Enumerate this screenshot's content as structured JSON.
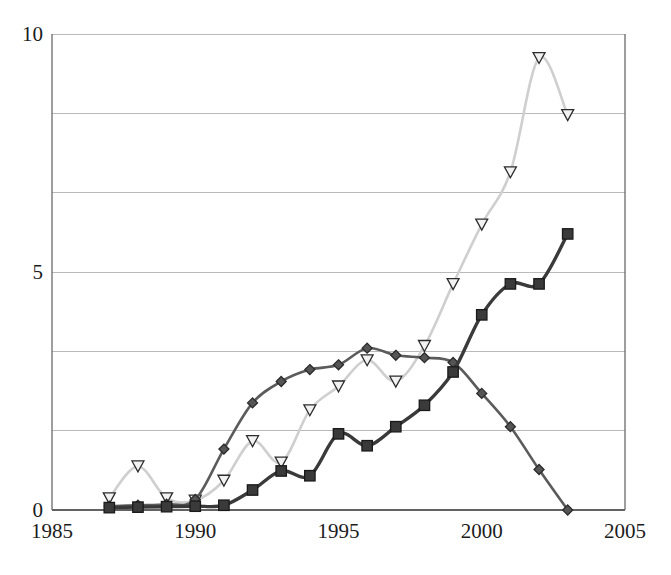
{
  "chart_data": {
    "type": "line",
    "title": "",
    "subtitle": "",
    "xlabel": "",
    "ylabel": "",
    "xlim": [
      1985,
      2005
    ],
    "ylim": [
      0,
      10
    ],
    "grid": true,
    "grid_axis": "y",
    "legend": "none",
    "x_ticks": [
      1985,
      1990,
      1995,
      2000,
      2005
    ],
    "x_tick_labels": [
      "1985",
      "1990",
      "1995",
      "2000",
      "2005"
    ],
    "y_ticks": [
      0,
      5,
      10
    ],
    "y_tick_labels": [
      "0",
      "5",
      "10"
    ],
    "y_gridlines": [
      0,
      1.667,
      3.333,
      5,
      6.667,
      8.333,
      10
    ],
    "x": [
      1987,
      1988,
      1989,
      1990,
      1991,
      1992,
      1993,
      1994,
      1995,
      1996,
      1997,
      1998,
      1999,
      2000,
      2001,
      2002,
      2003
    ],
    "series": [
      {
        "name": "light-triangle-series",
        "marker": "triangle-down",
        "color": "#cfcfcf",
        "marker_fill": "#f2f2f2",
        "marker_stroke": "#2b2b2b",
        "line_width": 2.6,
        "values": [
          0.25,
          0.92,
          0.25,
          0.2,
          0.62,
          1.45,
          1.0,
          2.1,
          2.6,
          3.15,
          2.7,
          3.45,
          4.75,
          6.0,
          7.1,
          9.5,
          8.3
        ]
      },
      {
        "name": "dark-diamond-series",
        "marker": "diamond",
        "color": "#5b5b5b",
        "marker_fill": "#555555",
        "marker_stroke": "#2b2b2b",
        "line_width": 2.6,
        "values": [
          0.08,
          0.1,
          0.12,
          0.22,
          1.28,
          2.25,
          2.7,
          2.95,
          3.05,
          3.4,
          3.25,
          3.2,
          3.1,
          2.45,
          1.75,
          0.85,
          0.0
        ]
      },
      {
        "name": "black-square-series",
        "marker": "square",
        "color": "#3a3a3a",
        "marker_fill": "#3a3a3a",
        "marker_stroke": "#1a1a1a",
        "line_width": 3.4,
        "values": [
          0.05,
          0.06,
          0.07,
          0.08,
          0.1,
          0.42,
          0.82,
          0.72,
          1.6,
          1.35,
          1.75,
          2.2,
          2.9,
          4.1,
          4.75,
          4.75,
          5.8
        ]
      }
    ]
  }
}
